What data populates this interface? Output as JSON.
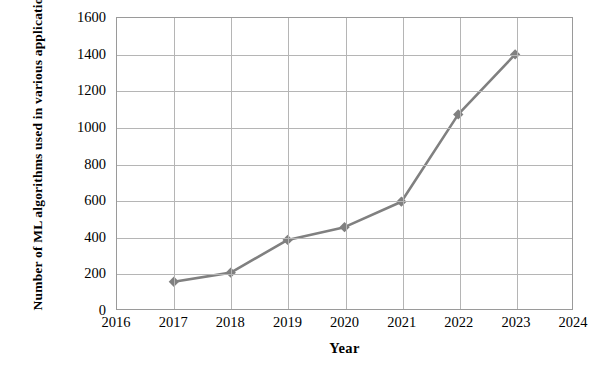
{
  "chart_data": {
    "type": "line",
    "title": "",
    "xlabel": "Year",
    "ylabel": "Number of ML algorithms used in various applications (in $ Million)",
    "x": [
      2017,
      2018,
      2019,
      2020,
      2021,
      2022,
      2023
    ],
    "values": [
      150,
      200,
      380,
      450,
      590,
      1070,
      1400
    ],
    "series": [
      {
        "name": "Number of ML algorithms",
        "x": [
          2017,
          2018,
          2019,
          2020,
          2021,
          2022,
          2023
        ],
        "values": [
          150,
          200,
          380,
          450,
          590,
          1070,
          1400
        ]
      }
    ],
    "xlim": [
      2016,
      2024
    ],
    "ylim": [
      0,
      1600
    ],
    "xticks": [
      2016,
      2017,
      2018,
      2019,
      2020,
      2021,
      2022,
      2023,
      2024
    ],
    "yticks": [
      0,
      200,
      400,
      600,
      800,
      1000,
      1200,
      1400,
      1600
    ],
    "xtick_labels": [
      "2016",
      "2017",
      "2018",
      "2019",
      "2020",
      "2021",
      "2022",
      "2023",
      "2024"
    ],
    "ytick_labels": [
      "0",
      "200",
      "400",
      "600",
      "800",
      "1000",
      "1200",
      "1400",
      "1600"
    ],
    "grid": {
      "horizontal": true,
      "vertical": true,
      "color": "#b5b5b5"
    },
    "legend": {
      "visible": false,
      "position": "none"
    },
    "marker": "diamond",
    "line_color": "#808080",
    "marker_color": "#808080",
    "plot_border_color": "#9a9a9a",
    "background_color": "#ffffff"
  }
}
